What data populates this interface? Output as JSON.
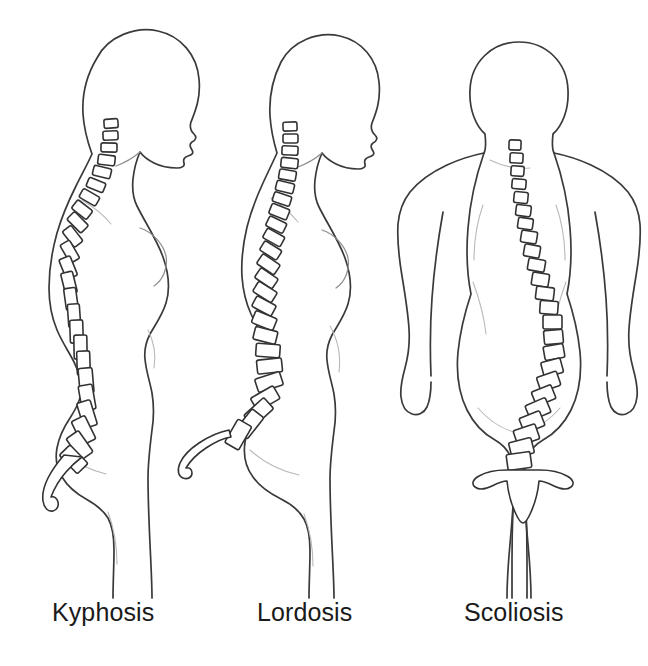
{
  "illustration": {
    "title": "Spinal curvature disorders comparison",
    "background_color": "#ffffff",
    "outline_color": "#3a3a3c",
    "vertebra_stroke_color": "#333336",
    "vertebra_fill_color": "#ffffff",
    "soft_contour_color": "#b9b9bd",
    "caption_color": "#1a1a1a"
  },
  "figures": [
    {
      "id": "kyphosis",
      "label": "Kyphosis",
      "view": "lateral-left-profile",
      "sex_presentation": "female",
      "description": "Side profile showing exaggerated outward rounding of the upper back (thoracic hunchback) with forward head posture",
      "vertebra_count": 24,
      "has_sacrum": true
    },
    {
      "id": "lordosis",
      "label": "Lordosis",
      "view": "lateral-left-profile",
      "sex_presentation": "female",
      "description": "Side profile showing exaggerated inward curve of the lower back (lumbar swayback) with protruding buttocks and abdomen",
      "vertebra_count": 24,
      "has_sacrum": true
    },
    {
      "id": "scoliosis",
      "label": "Scoliosis",
      "view": "posterior-rear",
      "sex_presentation": "female",
      "description": "Rear view showing sideways S-shaped lateral curvature of the spine with uneven shoulders and hips",
      "vertebra_count": 24,
      "has_sacrum": true
    }
  ],
  "captions": {
    "kyphosis": "Kyphosis",
    "lordosis": "Lordosis",
    "scoliosis": "Scoliosis"
  }
}
